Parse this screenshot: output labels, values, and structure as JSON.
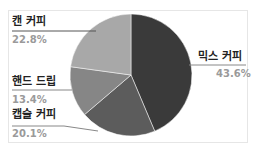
{
  "chart_data": {
    "type": "pie",
    "title": "",
    "categories": [
      "믹스 커피",
      "캡슐 커피",
      "핸드 드립",
      "캔 커피"
    ],
    "values": [
      43.6,
      20.1,
      13.4,
      22.8
    ],
    "labels": [
      "43.6%",
      "20.1%",
      "13.4%",
      "22.8%"
    ],
    "colors": [
      "#3a3a3a",
      "#5c5c5c",
      "#868686",
      "#a8a8a8"
    ],
    "start_angle": "top, clockwise",
    "legend": "none (data labels with leader lines)"
  },
  "labels": {
    "mix": {
      "name": "믹스 커피",
      "pct": "43.6%"
    },
    "capsule": {
      "name": "캡슐 커피",
      "pct": "20.1%"
    },
    "hand": {
      "name": "핸드 드립",
      "pct": "13.4%"
    },
    "can": {
      "name": "캔 커피",
      "pct": "22.8%"
    }
  }
}
